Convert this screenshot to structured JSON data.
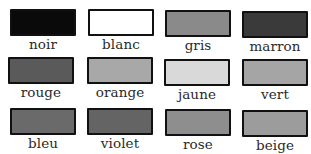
{
  "colors": [
    {
      "label": "noir",
      "swatch": "#0a0a0a"
    },
    {
      "label": "blanc",
      "swatch": "#ffffff"
    },
    {
      "label": "gris",
      "swatch": "#8a8a8a"
    },
    {
      "label": "marron",
      "swatch": "#3a3a3a"
    },
    {
      "label": "rouge",
      "swatch": "#5a5a5a"
    },
    {
      "label": "orange",
      "swatch": "#a8a8a8"
    },
    {
      "label": "jaune",
      "swatch": "#d9d9d9"
    },
    {
      "label": "vert",
      "swatch": "#a5a5a5"
    },
    {
      "label": "bleu",
      "swatch": "#6a6a6a"
    },
    {
      "label": "violet",
      "swatch": "#646464"
    },
    {
      "label": "rose",
      "swatch": "#8e8e8e"
    },
    {
      "label": "beige",
      "swatch": "#9c9c9c"
    }
  ]
}
